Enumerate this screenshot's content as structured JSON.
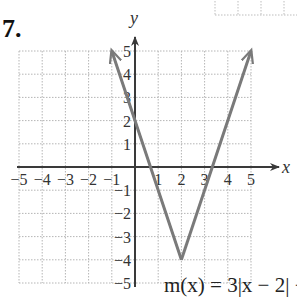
{
  "problem": {
    "number_label": "7."
  },
  "chart_data": {
    "type": "line",
    "title": "",
    "function_label": "m(x) = 3|x − 2| − 4",
    "function": "m(x) = 3|x - 2| - 4",
    "xlabel": "x",
    "ylabel": "y",
    "xlim": [
      -5,
      5
    ],
    "ylim": [
      -5,
      5
    ],
    "grid": true,
    "x_tick_labels": [
      "−5",
      "−4",
      "−3",
      "−2",
      "−1",
      "1",
      "2",
      "3",
      "4",
      "5"
    ],
    "y_tick_labels": [
      "5",
      "4",
      "3",
      "2",
      "1",
      "−1",
      "−2",
      "−3",
      "−4",
      "−5"
    ],
    "series": [
      {
        "name": "m(x)",
        "points": [
          {
            "x": -1,
            "y": 5
          },
          {
            "x": 0,
            "y": 2
          },
          {
            "x": 2,
            "y": -4
          },
          {
            "x": 4,
            "y": 2
          },
          {
            "x": 5,
            "y": 5
          }
        ],
        "vertex": {
          "x": 2,
          "y": -4
        },
        "arrows_at_ends": true,
        "color": "#7a7a7a"
      }
    ],
    "colors": {
      "axis": "#3a3a3a",
      "grid": "#b5b5b5",
      "curve": "#7a7a7a"
    }
  }
}
